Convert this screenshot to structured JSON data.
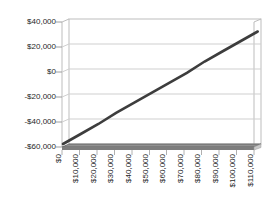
{
  "chart_data": {
    "type": "line",
    "title": "",
    "xlabel": "",
    "ylabel": "",
    "categories": [
      "$0",
      "$10,000",
      "$20,000",
      "$30,000",
      "$40,000",
      "$50,000",
      "$60,000",
      "$70,000",
      "$80,000",
      "$90,000",
      "$100,000",
      "$110,000"
    ],
    "x_values": [
      0,
      10000,
      20000,
      30000,
      40000,
      50000,
      60000,
      70000,
      80000,
      90000,
      100000,
      110000
    ],
    "series": [
      {
        "name": "profit-line",
        "color": "#3d3d3d",
        "values": [
          -60000,
          -52000,
          -44000,
          -35000,
          -27000,
          -19000,
          -11000,
          -3000,
          6000,
          14000,
          22000,
          30000
        ]
      }
    ],
    "yticks": [
      {
        "label": "$40,000",
        "value": 40000
      },
      {
        "label": "$20,000",
        "value": 20000
      },
      {
        "label": "$0",
        "value": 0
      },
      {
        "label": "-$20,000",
        "value": -20000
      },
      {
        "label": "-$40,000",
        "value": -40000
      },
      {
        "label": "-$60,000",
        "value": -60000
      }
    ],
    "ylim": [
      -60000,
      40000
    ],
    "grid": "horizontal",
    "legend": "none",
    "x_tick_rotation": -90,
    "style_3d_perspective": true,
    "colors": {
      "line": "#3d3d3d",
      "gridline": "#cfcfcf",
      "wall": "#bdbdbd",
      "floor_top": "#919191",
      "floor_front": "#7d7d7d",
      "floor_side": "#c9c9c9",
      "background": "#ffffff",
      "text": "#1f1f1f"
    }
  }
}
